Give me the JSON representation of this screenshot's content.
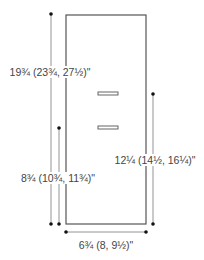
{
  "diagram": {
    "colors": {
      "outline": "#555555",
      "dimension_line": "#888888",
      "dot": "#111111",
      "label": "#444444",
      "slot_fill": "#ffffff"
    },
    "panel": {
      "x": 66,
      "y": 15,
      "width": 80,
      "height": 209
    },
    "slots": [
      {
        "name": "upper-slot",
        "x": 98,
        "y": 92,
        "width": 20,
        "height": 3
      },
      {
        "name": "lower-slot",
        "x": 98,
        "y": 126,
        "width": 20,
        "height": 3
      }
    ],
    "dimensions": {
      "total_length": {
        "label": "19¾ (23¾, 27½)\"",
        "line": {
          "x": 51,
          "y1": 14,
          "y2": 224
        },
        "label_pos": {
          "x": 50,
          "y": 72
        }
      },
      "lower_length": {
        "label": "8¾ (10¾, 11¾)\"",
        "line": {
          "x": 59,
          "y1": 128,
          "y2": 224
        },
        "label_pos": {
          "x": 58,
          "y": 178
        }
      },
      "right_length": {
        "label": "12¼ (14½, 16¼)\"",
        "line": {
          "x": 153,
          "y1": 94,
          "y2": 224
        },
        "label_pos": {
          "x": 155,
          "y": 160
        }
      },
      "width": {
        "label": "6¾ (8, 9½)\"",
        "line": {
          "y": 232,
          "x1": 66,
          "x2": 146
        },
        "label_pos": {
          "x": 106,
          "y": 245
        }
      }
    }
  }
}
